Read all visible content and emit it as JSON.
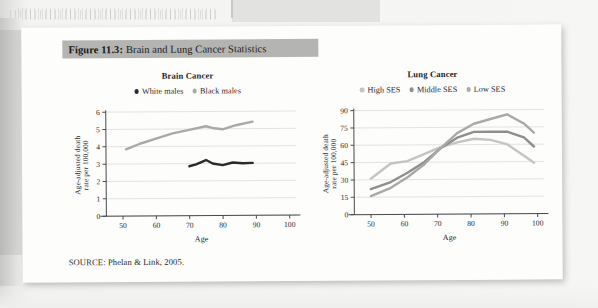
{
  "figure": {
    "number_label": "Figure 11.3:",
    "title": "Brain and Lung Cancer Statistics",
    "source": "SOURCE: Phelan & Link, 2005."
  },
  "colors": {
    "title_bar_bg": "#b4b4b2",
    "card_bg": "#fdfdfc",
    "page_bg": "#f2f2f1",
    "white_males": "#2b2b2e",
    "black_males": "#a9a9a7",
    "high_ses": "#c4c4c2",
    "middle_ses": "#8e8e8c",
    "low_ses": "#a9a9a7",
    "grid": "#dcdcda",
    "axis": "#4a4a4e"
  },
  "chart_data": [
    {
      "type": "line",
      "title": "Brain Cancer",
      "xlabel": "Age",
      "ylabel": "Age-adjusted death\nrate per 100,000",
      "ylabel_line1": "Age-adjusted death",
      "ylabel_line2": "rate per 100,000",
      "xlim": [
        45,
        102
      ],
      "ylim": [
        0,
        6
      ],
      "xticks": [
        50,
        60,
        70,
        80,
        90,
        100
      ],
      "yticks": [
        0,
        1,
        2,
        3,
        4,
        5,
        6
      ],
      "grid": true,
      "legend_position": "top-center",
      "series": [
        {
          "name": "White males",
          "color": "#2b2b2e",
          "x": [
            70,
            72,
            75,
            77,
            80,
            83,
            86,
            89
          ],
          "values": [
            2.85,
            2.95,
            3.2,
            3.0,
            2.9,
            3.05,
            3.0,
            3.02
          ]
        },
        {
          "name": "Black males",
          "color": "#a9a9a7",
          "x": [
            51,
            55,
            60,
            65,
            70,
            75,
            77,
            80,
            84,
            89
          ],
          "values": [
            3.85,
            4.15,
            4.45,
            4.75,
            4.95,
            5.15,
            5.05,
            4.97,
            5.2,
            5.4
          ]
        }
      ]
    },
    {
      "type": "line",
      "title": "Lung Cancer",
      "xlabel": "Age",
      "ylabel": "Age-adjusted death\nrate per 100,000",
      "ylabel_line1": "Age-adjusted death",
      "ylabel_line2": "rate per 100,000",
      "xlim": [
        45,
        102
      ],
      "ylim": [
        0,
        90
      ],
      "xticks": [
        50,
        60,
        70,
        80,
        90,
        100
      ],
      "yticks": [
        0,
        15,
        30,
        45,
        60,
        75,
        90
      ],
      "grid": true,
      "legend_position": "top-center",
      "series": [
        {
          "name": "High SES",
          "color": "#c4c4c2",
          "x": [
            50,
            56,
            61,
            66,
            71,
            76,
            81,
            86,
            91,
            96,
            99
          ],
          "values": [
            31,
            44,
            46,
            52,
            58,
            62,
            65,
            64,
            60,
            50,
            44
          ]
        },
        {
          "name": "Middle SES",
          "color": "#8e8e8c",
          "x": [
            50,
            56,
            61,
            66,
            71,
            76,
            81,
            86,
            91,
            96,
            99
          ],
          "values": [
            22,
            28,
            36,
            45,
            57,
            66,
            71,
            71,
            71,
            66,
            58
          ]
        },
        {
          "name": "Low SES",
          "color": "#a9a9a7",
          "x": [
            50,
            56,
            61,
            66,
            71,
            76,
            81,
            86,
            91,
            96,
            99
          ],
          "values": [
            16,
            23,
            32,
            43,
            57,
            70,
            78,
            82,
            86,
            78,
            70
          ]
        }
      ]
    }
  ]
}
